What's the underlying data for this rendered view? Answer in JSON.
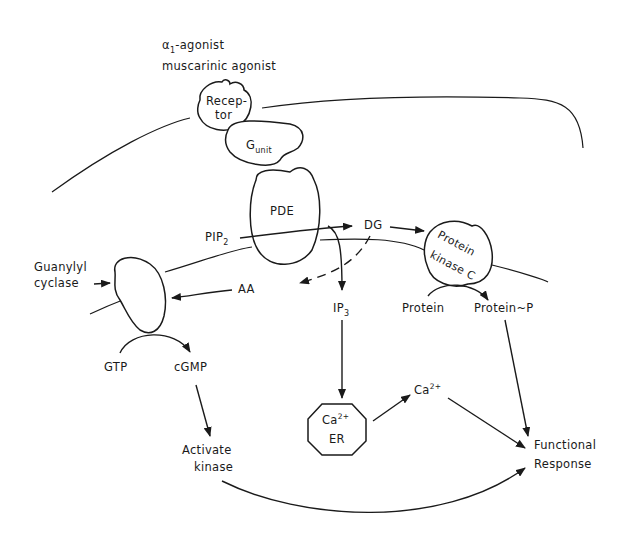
{
  "diagram": {
    "agonist_line1": "α",
    "agonist_line1_sub": "1",
    "agonist_line1_rest": "-agonist",
    "agonist_line2": "muscarinic agonist",
    "receptor_line1": "Recep-",
    "receptor_line2": "tor",
    "gunit_main": "G",
    "gunit_sub": "unit",
    "pde": "PDE",
    "pip_main": "PIP",
    "pip_sub": "2",
    "dg": "DG",
    "pkc_line1": "Protein",
    "pkc_line2": "kinase C",
    "guanylyl_line1": "Guanylyl",
    "guanylyl_line2": "cyclase",
    "aa": "AA",
    "ip_main": "IP",
    "ip_sub": "3",
    "protein": "Protein",
    "protein_p": "Protein~P",
    "gtp": "GTP",
    "cgmp": "cGMP",
    "er_ca": "Ca",
    "er_ca_sup": "2+",
    "er_label": "ER",
    "ca_main": "Ca",
    "ca_sup": "2+",
    "activate_line1": "Activate",
    "activate_line2": "kinase",
    "functional_line1": "Functional",
    "functional_line2": "Response"
  }
}
